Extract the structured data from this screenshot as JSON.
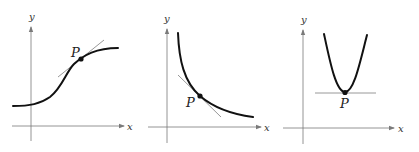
{
  "figure": {
    "panels": [
      {
        "id": "left",
        "description": "S-shaped increasing curve with tangent line at point P",
        "x_axis_label": "x",
        "y_axis_label": "y",
        "point_label": "P",
        "colors": {
          "curve": "#111111",
          "tangent": "#8c8c8c",
          "axis": "#7a7a7a"
        }
      },
      {
        "id": "middle",
        "description": "Decreasing convex curve with tangent line at point P",
        "x_axis_label": "x",
        "y_axis_label": "y",
        "point_label": "P",
        "colors": {
          "curve": "#111111",
          "tangent": "#8c8c8c",
          "axis": "#7a7a7a"
        }
      },
      {
        "id": "right",
        "description": "Upward parabola with horizontal tangent line at vertex P",
        "x_axis_label": "x",
        "y_axis_label": "y",
        "point_label": "P",
        "colors": {
          "curve": "#111111",
          "tangent": "#8c8c8c",
          "axis": "#7a7a7a"
        }
      }
    ]
  }
}
